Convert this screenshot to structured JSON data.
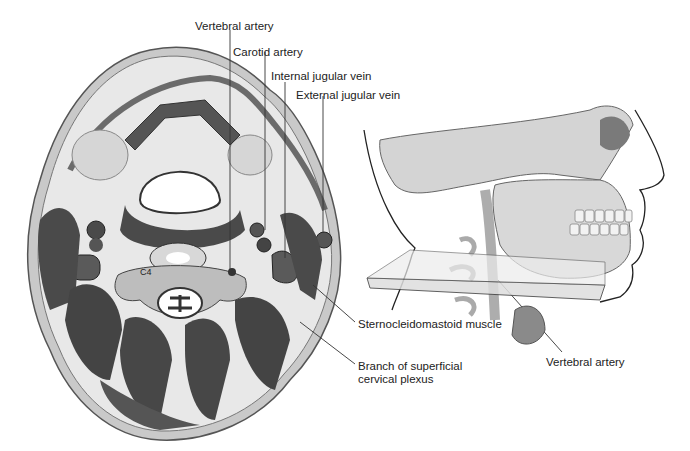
{
  "figure": {
    "cross_section": {
      "vertebra_label": "C4"
    },
    "labels": {
      "vertebral_artery_top": "Vertebral artery",
      "carotid_artery": "Carotid artery",
      "internal_jugular_vein": "Internal jugular vein",
      "external_jugular_vein": "External jugular vein",
      "sternocleidomastoid_muscle": "Sternocleidomastoid muscle",
      "branch_superficial_line1": "Branch of superficial",
      "branch_superficial_line2": "cervical plexus",
      "vertebral_artery_bottom": "Vertebral artery"
    },
    "colors": {
      "skin": "#c8c8c8",
      "fat": "#e6e6e6",
      "muscle": "#4a4a4a",
      "bone": "#cfcfcf",
      "line": "#333333"
    }
  }
}
